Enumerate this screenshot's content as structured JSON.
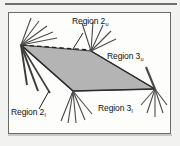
{
  "figure": {
    "background_color": "#fdfdfc",
    "frame_color": "#6a6a6a",
    "shade_fill_color": "#b4b4b4",
    "shade_edge_color": "#3a3a3a",
    "line_color": "#4a4a4a",
    "dashed_line_color": "#2d2d2d",
    "labels": [
      {
        "id": "region-2-upper",
        "base": "Region 2",
        "subscript": "u"
      },
      {
        "id": "region-3-upper",
        "base": "Region 3",
        "subscript": "u"
      },
      {
        "id": "region-3-lower",
        "base": "Region 3",
        "subscript": "l"
      },
      {
        "id": "region-2-lower",
        "base": "Region 2",
        "subscript": "l"
      }
    ],
    "vertices": {
      "left": "V1",
      "top_right": "V2",
      "right": "V3",
      "bottom_mid": "V4"
    }
  },
  "labels": {
    "region2u": {
      "base": "Region 2",
      "sub": "u"
    },
    "region3u": {
      "base": "Region 3",
      "sub": "u"
    },
    "region3l": {
      "base": "Region 3",
      "sub": "l"
    },
    "region2l": {
      "base": "Region 2",
      "sub": "l"
    }
  }
}
